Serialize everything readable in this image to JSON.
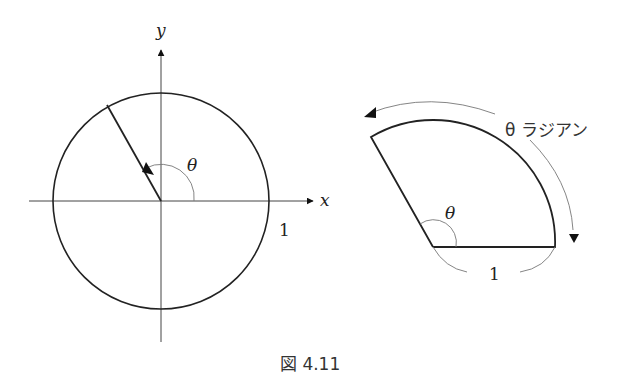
{
  "figure": {
    "caption": "図 4.11",
    "left": {
      "y_axis_label": "y",
      "x_axis_label": "x",
      "angle_label": "θ",
      "radius_label": "1"
    },
    "right": {
      "arc_label": "θ ラジアン",
      "angle_label": "θ",
      "radius_label": "1"
    }
  }
}
